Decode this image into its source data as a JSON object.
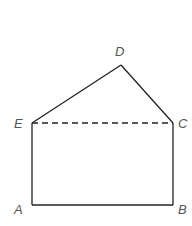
{
  "figure": {
    "type": "geometry",
    "points": {
      "A": {
        "label": "A",
        "x": 32,
        "y": 205
      },
      "B": {
        "label": "B",
        "x": 173,
        "y": 205
      },
      "C": {
        "label": "C",
        "x": 173,
        "y": 123
      },
      "D": {
        "label": "D",
        "x": 121,
        "y": 65
      },
      "E": {
        "label": "E",
        "x": 32,
        "y": 123
      }
    },
    "labels": {
      "A": "A",
      "B": "B",
      "C": "C",
      "D": "D",
      "E": "E"
    },
    "segments": [
      {
        "from": "A",
        "to": "B",
        "style": "solid"
      },
      {
        "from": "B",
        "to": "C",
        "style": "solid"
      },
      {
        "from": "C",
        "to": "D",
        "style": "solid"
      },
      {
        "from": "D",
        "to": "E",
        "style": "solid"
      },
      {
        "from": "E",
        "to": "A",
        "style": "solid"
      },
      {
        "from": "E",
        "to": "C",
        "style": "dashed"
      }
    ],
    "line_color": "#222222"
  }
}
